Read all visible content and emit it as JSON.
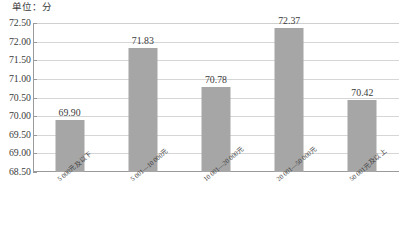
{
  "unit_caption": "单位：分",
  "chart_data": {
    "type": "bar",
    "title": "",
    "subtitle": "",
    "xlabel": "",
    "ylabel": "",
    "unit": "单位：分",
    "categories": [
      "5 000元及以下",
      "5 001—10 000元",
      "10 001—20 000元",
      "20 001—50 000元",
      "50 001元及以上"
    ],
    "values": [
      69.9,
      71.83,
      70.78,
      72.37,
      70.42
    ],
    "value_labels": [
      "69.90",
      "71.83",
      "70.78",
      "72.37",
      "70.42"
    ],
    "ylim": [
      68.5,
      72.5
    ],
    "ytick_values": [
      72.5,
      72.0,
      71.5,
      71.0,
      70.5,
      70.0,
      69.5,
      69.0,
      68.5
    ],
    "ytick_labels": [
      "72.50",
      "72.00",
      "71.50",
      "71.00",
      "70.50",
      "70.00",
      "69.50",
      "69.00",
      "68.50"
    ],
    "grid": true,
    "grid_axis": "y",
    "legend": false,
    "legend_position": "none",
    "bar_color": "#a6a6a6",
    "gridline_color": "#d6d6d6",
    "axis_color": "#9a9a9a",
    "text_color": "#3b3b3b",
    "background": "#ffffff"
  }
}
